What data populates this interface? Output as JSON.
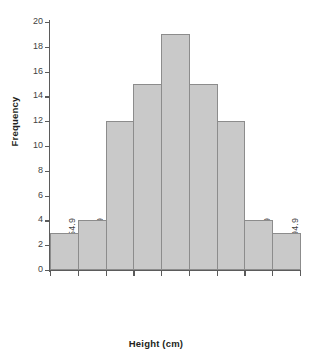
{
  "chart_data": {
    "type": "bar",
    "title": "",
    "subtitle": "",
    "xlabel": "Height (cm)",
    "ylabel": "Frequency",
    "categories": [
      "150.0–154.9",
      "155.0–159.9",
      "160.0–164.9",
      "165.0–169.9",
      "170.0–174.9",
      "175.0–179.9",
      "180.0–184.9",
      "185.0–189.9",
      "190.0–194.9"
    ],
    "values": [
      3,
      4,
      12,
      15,
      19,
      15,
      12,
      4,
      3
    ],
    "ylim": [
      0,
      20
    ],
    "ytick_values": [
      0,
      2,
      4,
      6,
      8,
      10,
      12,
      14,
      16,
      18,
      20
    ],
    "ytick_labels": [
      "0",
      "2",
      "4",
      "6",
      "8",
      "10",
      "12",
      "14",
      "16",
      "18",
      "20"
    ],
    "grid": false,
    "legend": "none",
    "bar_fill_color": "#c9c9c9",
    "bar_border_color": "#8c8c8c",
    "axis_color": "#5b5b5b",
    "background_color": "#ffffff",
    "bar_gap": 0
  }
}
